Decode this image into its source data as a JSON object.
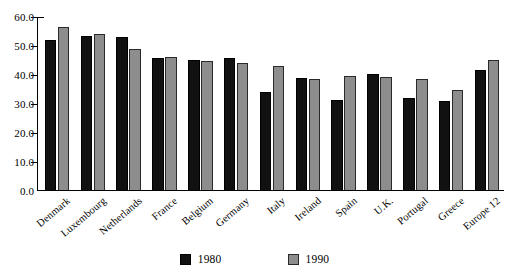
{
  "chart_data": {
    "type": "bar",
    "title": "",
    "subtitle": "",
    "xlabel": "",
    "ylabel": "",
    "ylim": [
      0.0,
      60.0
    ],
    "ytick_labels": [
      "0.0",
      "10.0",
      "20.0",
      "30.0",
      "40.0",
      "50.0",
      "60.0"
    ],
    "ytick_values": [
      0.0,
      10.0,
      20.0,
      30.0,
      40.0,
      50.0,
      60.0
    ],
    "grid": false,
    "legend_position": "bottom-center",
    "categories": [
      "Denmark",
      "Luxembourg",
      "Netherlands",
      "France",
      "Belgium",
      "Germany",
      "Italy",
      "Ireland",
      "Spain",
      "U.K.",
      "Portugal",
      "Greece",
      "Europe 12"
    ],
    "series": [
      {
        "name": "1980",
        "color": "#111111",
        "values": [
          52.0,
          53.5,
          53.0,
          45.8,
          45.3,
          46.0,
          34.0,
          39.0,
          31.3,
          40.3,
          32.0,
          31.0,
          41.8
        ]
      },
      {
        "name": "1990",
        "color": "#8d8d8d",
        "values": [
          56.5,
          54.3,
          48.9,
          46.3,
          45.0,
          44.3,
          43.0,
          38.5,
          39.8,
          39.3,
          38.5,
          35.0,
          45.2
        ]
      }
    ]
  },
  "legend": {
    "entries": [
      {
        "label": "1980",
        "swatch": "black-square-swatch"
      },
      {
        "label": "1990",
        "swatch": "gray-square-swatch"
      }
    ]
  }
}
